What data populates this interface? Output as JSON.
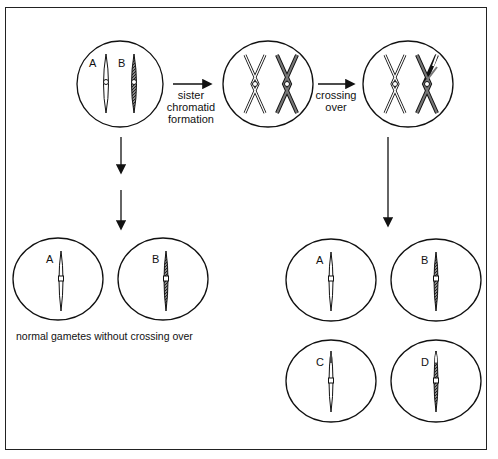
{
  "diagram": {
    "colors": {
      "stroke": "#111111",
      "hatch": "#555555",
      "background": "#ffffff"
    },
    "top_row": {
      "cell1": {
        "labels": [
          "A",
          "B"
        ],
        "description": "homologous chromosomes"
      },
      "arrow1_label_lines": [
        "sister",
        "chromatid",
        "formation"
      ],
      "cell2": {
        "description": "sister chromatids formed"
      },
      "arrow2_label_lines": [
        "crossing",
        "over"
      ],
      "cell3": {
        "description": "after crossing over"
      }
    },
    "left_gametes": {
      "labels": [
        "A",
        "B"
      ],
      "caption": "normal gametes without crossing over"
    },
    "right_gametes": {
      "labels": [
        "A",
        "B",
        "C",
        "D"
      ]
    }
  }
}
